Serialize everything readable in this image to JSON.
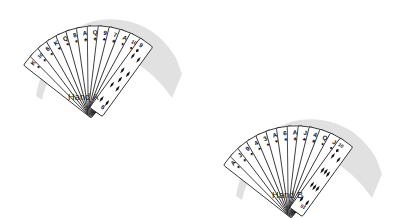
{
  "figure": {
    "background_color": "#ffffff",
    "line_color": "#1d1d1d",
    "shadow_color": "#c9c9c9",
    "pip_color": "#111111"
  },
  "hands": [
    {
      "id": "hand-a",
      "label": "Hand A",
      "card_count": 13,
      "position": "upper-left",
      "face_up_card": {
        "rank": "9",
        "suit": "diamonds",
        "suit_symbol": "♦"
      },
      "cards": [
        {
          "rank": "K",
          "suit": "spades",
          "suit_symbol": "♠"
        },
        {
          "rank": "10",
          "suit": "spades",
          "suit_symbol": "♠"
        },
        {
          "rank": "6",
          "suit": "spades",
          "suit_symbol": "♠"
        },
        {
          "rank": "K",
          "suit": "hearts",
          "suit_symbol": "♥"
        },
        {
          "rank": "Q",
          "suit": "hearts",
          "suit_symbol": "♥"
        },
        {
          "rank": "8",
          "suit": "hearts",
          "suit_symbol": "♥"
        },
        {
          "rank": "A",
          "suit": "clubs",
          "suit_symbol": "♣"
        },
        {
          "rank": "Q",
          "suit": "clubs",
          "suit_symbol": "♣"
        },
        {
          "rank": "9",
          "suit": "clubs",
          "suit_symbol": "♣"
        },
        {
          "rank": "7",
          "suit": "clubs",
          "suit_symbol": "♣"
        },
        {
          "rank": "A",
          "suit": "diamonds",
          "suit_symbol": "♦"
        },
        {
          "rank": "10",
          "suit": "diamonds",
          "suit_symbol": "♦"
        },
        {
          "rank": "9",
          "suit": "diamonds",
          "suit_symbol": "♦"
        }
      ]
    },
    {
      "id": "hand-b",
      "label": "Hand B",
      "card_count": 13,
      "position": "lower-right",
      "face_up_card": {
        "rank": "10",
        "suit": "diamonds",
        "suit_symbol": "♦"
      },
      "cards": [
        {
          "rank": "A",
          "suit": "spades",
          "suit_symbol": "♠"
        },
        {
          "rank": "J",
          "suit": "spades",
          "suit_symbol": "♠"
        },
        {
          "rank": "9",
          "suit": "spades",
          "suit_symbol": "♠"
        },
        {
          "rank": "4",
          "suit": "spades",
          "suit_symbol": "♠"
        },
        {
          "rank": "3",
          "suit": "spades",
          "suit_symbol": "♠"
        },
        {
          "rank": "A",
          "suit": "hearts",
          "suit_symbol": "♥"
        },
        {
          "rank": "6",
          "suit": "hearts",
          "suit_symbol": "♥"
        },
        {
          "rank": "A",
          "suit": "clubs",
          "suit_symbol": "♣"
        },
        {
          "rank": "J",
          "suit": "clubs",
          "suit_symbol": "♣"
        },
        {
          "rank": "4",
          "suit": "clubs",
          "suit_symbol": "♣"
        },
        {
          "rank": "Q",
          "suit": "diamonds",
          "suit_symbol": "♦"
        },
        {
          "rank": "J",
          "suit": "diamonds",
          "suit_symbol": "♦"
        },
        {
          "rank": "10",
          "suit": "diamonds",
          "suit_symbol": "♦"
        }
      ]
    }
  ]
}
